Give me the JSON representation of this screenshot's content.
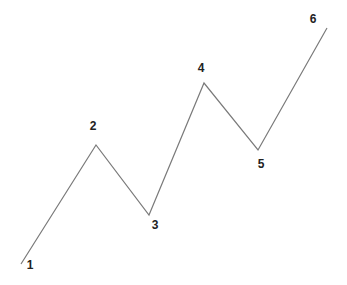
{
  "diagram": {
    "type": "zigzag-wave",
    "line_color": "#7a7a7a",
    "label_color": "#222222",
    "background": "#ffffff",
    "points": [
      {
        "label": "1",
        "x": 21,
        "y": 264,
        "lx": 30,
        "ly": 266
      },
      {
        "label": "2",
        "x": 96,
        "y": 145,
        "lx": 93,
        "ly": 127
      },
      {
        "label": "3",
        "x": 149,
        "y": 215,
        "lx": 155,
        "ly": 226
      },
      {
        "label": "4",
        "x": 204,
        "y": 83,
        "lx": 201,
        "ly": 69
      },
      {
        "label": "5",
        "x": 258,
        "y": 150,
        "lx": 261,
        "ly": 165
      },
      {
        "label": "6",
        "x": 327,
        "y": 28,
        "lx": 313,
        "ly": 20
      }
    ]
  }
}
